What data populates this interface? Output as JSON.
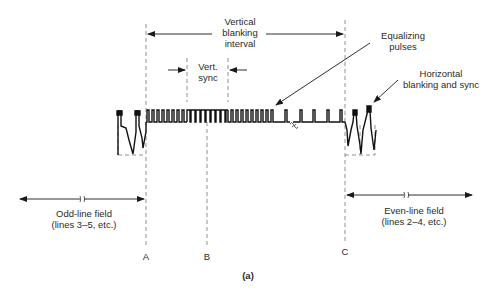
{
  "figure": {
    "caption": "(a)",
    "colors": {
      "ink": "#1a1a1a",
      "dash": "#777777",
      "background": "#ffffff"
    }
  },
  "labels": {
    "vertical_blanking": [
      "Vertical",
      "blanking",
      "interval"
    ],
    "vert_sync": [
      "Vert.",
      "sync"
    ],
    "equalizing": [
      "Equalizing",
      "pulses"
    ],
    "horizontal": [
      "Horizontal",
      "blanking and sync"
    ],
    "odd_field": [
      "Odd-line field",
      "(lines 3–5, etc.)"
    ],
    "even_field": [
      "Even-line field",
      "(lines 2–4, etc.)"
    ],
    "markers": {
      "a": "A",
      "b": "B",
      "c": "C"
    }
  },
  "markers_x": {
    "A": 146,
    "B": 207,
    "C": 345,
    "vsync_start": 187,
    "vsync_end": 228
  }
}
